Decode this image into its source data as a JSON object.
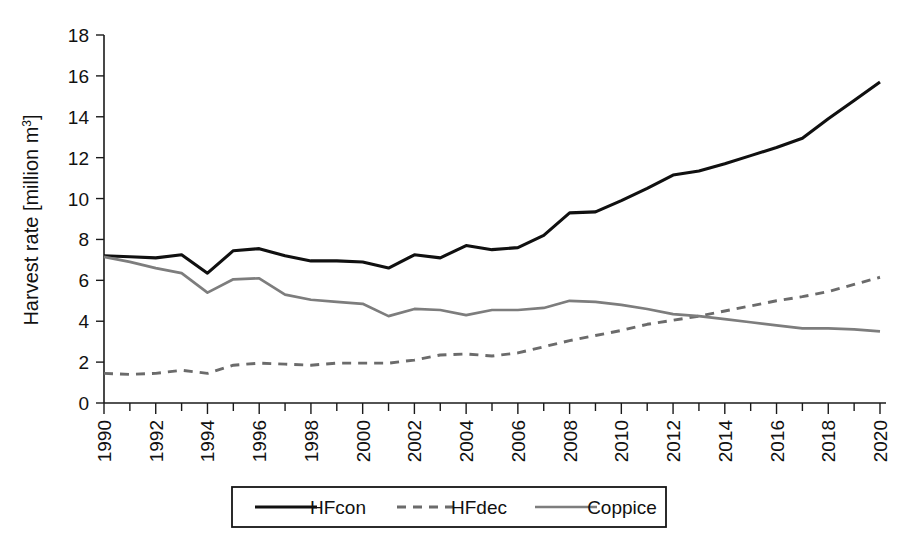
{
  "chart_data": {
    "type": "line",
    "title": "",
    "xlabel": "",
    "ylabel": "Harvest rate [million m³]",
    "ylabel_base": "Harvest rate [million m",
    "ylabel_sup": "3",
    "ylabel_close": "]",
    "xlim": [
      1990,
      2020
    ],
    "ylim": [
      0,
      18
    ],
    "ytick_values": [
      0,
      2,
      4,
      6,
      8,
      10,
      12,
      14,
      16,
      18
    ],
    "ytick_labels": [
      "0",
      "2",
      "4",
      "6",
      "8",
      "10",
      "12",
      "14",
      "16",
      "18"
    ],
    "xtick_values": [
      1990,
      1992,
      1994,
      1996,
      1998,
      2000,
      2002,
      2004,
      2006,
      2008,
      2010,
      2012,
      2014,
      2016,
      2018,
      2020
    ],
    "xtick_labels": [
      "1990",
      "1992",
      "1994",
      "1996",
      "1998",
      "2000",
      "2002",
      "2004",
      "2006",
      "2008",
      "2010",
      "2012",
      "2014",
      "2016",
      "2018",
      "2020"
    ],
    "xtick_minor_step": 1,
    "grid": false,
    "legend_position": "below-axis-center",
    "x": [
      1990,
      1991,
      1992,
      1993,
      1994,
      1995,
      1996,
      1997,
      1998,
      1999,
      2000,
      2001,
      2002,
      2003,
      2004,
      2005,
      2006,
      2007,
      2008,
      2009,
      2010,
      2011,
      2012,
      2013,
      2014,
      2015,
      2016,
      2017,
      2018,
      2019,
      2020
    ],
    "series": [
      {
        "name": "HFcon",
        "style": "solid",
        "color": "#101010",
        "values": [
          7.2,
          7.15,
          7.1,
          7.25,
          6.35,
          7.45,
          7.55,
          7.2,
          6.95,
          6.95,
          6.9,
          6.6,
          7.25,
          7.1,
          7.7,
          7.5,
          7.6,
          8.2,
          9.3,
          9.35,
          9.9,
          10.5,
          11.15,
          11.35,
          11.7,
          12.1,
          12.5,
          12.95,
          13.9,
          14.8,
          15.7
        ]
      },
      {
        "name": "HFdec",
        "style": "dashed",
        "color": "#6b6b6b",
        "values": [
          1.45,
          1.4,
          1.45,
          1.6,
          1.45,
          1.85,
          1.95,
          1.9,
          1.85,
          1.95,
          1.95,
          1.95,
          2.1,
          2.35,
          2.4,
          2.3,
          2.45,
          2.75,
          3.05,
          3.3,
          3.55,
          3.85,
          4.05,
          4.25,
          4.5,
          4.75,
          5.0,
          5.2,
          5.45,
          5.8,
          6.15
        ]
      },
      {
        "name": "Coppice",
        "style": "solid",
        "color": "#7d7d7d",
        "values": [
          7.15,
          6.9,
          6.6,
          6.35,
          5.4,
          6.05,
          6.1,
          5.3,
          5.05,
          4.95,
          4.85,
          4.25,
          4.6,
          4.55,
          4.3,
          4.55,
          4.55,
          4.65,
          5.0,
          4.95,
          4.8,
          4.6,
          4.35,
          4.25,
          4.1,
          3.95,
          3.8,
          3.65,
          3.65,
          3.6,
          3.5
        ]
      }
    ]
  },
  "legend": {
    "entries": [
      {
        "label": "HFcon",
        "style": "solid",
        "color": "#101010"
      },
      {
        "label": "HFdec",
        "style": "dashed",
        "color": "#6b6b6b"
      },
      {
        "label": "Coppice",
        "style": "solid",
        "color": "#7d7d7d"
      }
    ]
  }
}
